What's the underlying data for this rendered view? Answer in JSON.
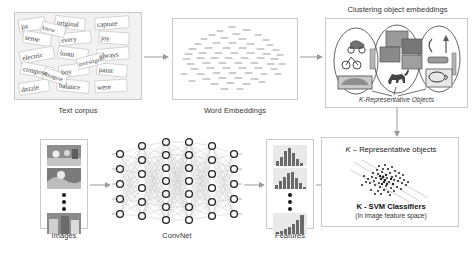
{
  "figure": {
    "type": "pipeline-diagram",
    "background": "#ffffff",
    "line_color": "#9a9a9a",
    "text_color": "#2b2b2b"
  },
  "top_row": {
    "text_corpus": {
      "label": "Text corpus",
      "icon": "word-collage-image",
      "words": [
        "original",
        "capture",
        "pa",
        "sense",
        "every",
        "joy",
        "electric",
        "loom",
        "always",
        "pig",
        "masterpiece",
        "know",
        "paint",
        "compose",
        "investigate",
        "boy",
        "wild",
        "dazzle",
        "imagine",
        "balance",
        "like",
        "nore",
        "were",
        "art"
      ]
    },
    "word_embeddings": {
      "label": "Word Embeddings",
      "icon": "scatter-plot-embedding",
      "point_count": 420
    },
    "clustering": {
      "header": "Clustering object embeddings",
      "inner_caption": "K-Representative Objects",
      "clusters": [
        {
          "name": "vehicles",
          "items": [
            "motorcycle",
            "bicycle",
            "car"
          ]
        },
        {
          "name": "animals-and-scenes",
          "items": [
            "photo",
            "photo",
            "photo",
            "horse"
          ]
        },
        {
          "name": "household-objects",
          "items": [
            "lamp",
            "cup",
            "table",
            "pen"
          ]
        }
      ]
    }
  },
  "bottom_row": {
    "images": {
      "label": "Images",
      "thumbnails": [
        "photo-1",
        "photo-2",
        "photo-n"
      ],
      "ellipsis": "vertical-dots"
    },
    "convnet": {
      "label": "ConvNet",
      "layer_sizes": [
        5,
        6,
        7,
        7,
        6,
        5
      ]
    },
    "features": {
      "label": "Features",
      "histograms": [
        "histogram-1",
        "histogram-2",
        "histogram-n"
      ],
      "ellipsis": "vertical-dots"
    },
    "classifiers": {
      "header": "K – Representative objects",
      "title": "K - SVM Classifiers",
      "subtitle": "(In image feature space)",
      "icon": "svm-scatter-hyperplane"
    }
  },
  "arrows": {
    "corpus_to_embeddings": "→",
    "embeddings_to_clustering": "→",
    "images_to_convnet": "→",
    "convnet_to_features": "→",
    "features_to_classifiers": "→",
    "clustering_to_classifiers": "↓"
  }
}
